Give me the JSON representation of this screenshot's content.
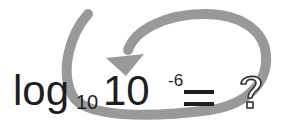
{
  "expression": {
    "function": "log",
    "subscript": "10",
    "base": "10",
    "exponent": "-6",
    "equals": "=",
    "unknown": "?"
  },
  "colors": {
    "text": "#1e1e1e",
    "arrow": "#999999",
    "background": "#ffffff"
  },
  "icons": {
    "arrow": "curved-loop-arrow-icon",
    "question": "question-mark-outline-icon"
  }
}
